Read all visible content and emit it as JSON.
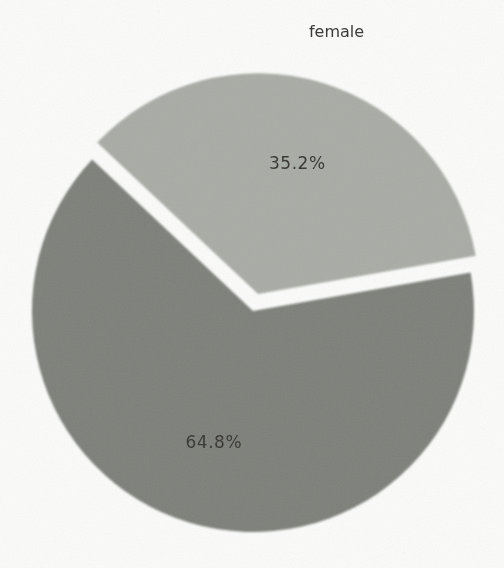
{
  "figure": {
    "background_color": "#fcfcfb",
    "text_color": "#34332f"
  },
  "chart_data": {
    "type": "pie",
    "title": "",
    "labels": [
      "female",
      ""
    ],
    "values": [
      35.2,
      64.8
    ],
    "pct_labels": [
      "35.2%",
      "64.8%"
    ],
    "colors": [
      "#a8aba4",
      "#7c7f78"
    ],
    "explode": [
      0.08,
      0
    ],
    "start_angle_deg": 10,
    "direction": "counterclockwise",
    "legend": "none",
    "pct_distance": 0.62,
    "label_distance": 1.24
  }
}
